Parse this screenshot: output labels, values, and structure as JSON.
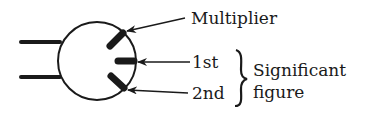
{
  "diagram": {
    "labels": {
      "multiplier": "Multiplier",
      "first": "1st",
      "second": "2nd",
      "significant": "Significant",
      "figure": "figure"
    },
    "brace": "}",
    "colors": {
      "ink": "#1a1a1a",
      "background": "#ffffff"
    }
  }
}
